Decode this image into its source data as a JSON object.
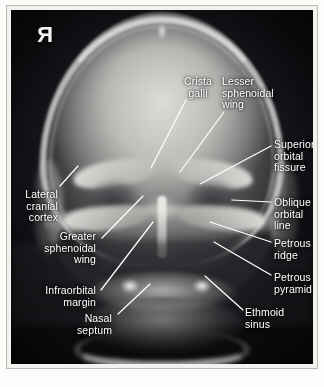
{
  "image": {
    "modality": "radiograph",
    "view": "PA skull (Caldwell) projection",
    "side_marker": "R",
    "background_color": "#16171b",
    "label_color": "#ffffff",
    "leader_color": "#ffffff",
    "frame_color": "#b9b9b4",
    "page_color": "#fcfcfa"
  },
  "annotations": [
    {
      "id": "crista-galli",
      "label": "Crista\ngalli",
      "align": "center",
      "text_x": 178,
      "text_y": 76,
      "text_w": 40,
      "leader": {
        "x1": 186,
        "y1": 100,
        "x2": 151,
        "y2": 168
      }
    },
    {
      "id": "lesser-sphenoidal-wing",
      "label": "Lesser\nsphenoidal\nwing",
      "align": "left",
      "text_x": 222,
      "text_y": 76,
      "text_w": 64,
      "leader": {
        "x1": 224,
        "y1": 112,
        "x2": 180,
        "y2": 172
      }
    },
    {
      "id": "superior-orbital-fissure",
      "label": "Superior\norbital\nfissure",
      "align": "left",
      "text_x": 274,
      "text_y": 139,
      "text_w": 52,
      "leader": {
        "x1": 271,
        "y1": 146,
        "x2": 200,
        "y2": 184
      }
    },
    {
      "id": "oblique-orbital-line",
      "label": "Oblique\norbital\nline",
      "align": "left",
      "text_x": 274,
      "text_y": 197,
      "text_w": 52,
      "leader": {
        "x1": 271,
        "y1": 202,
        "x2": 232,
        "y2": 200
      }
    },
    {
      "id": "petrous-ridge",
      "label": "Petrous\nridge",
      "align": "left",
      "text_x": 274,
      "text_y": 238,
      "text_w": 52,
      "leader": {
        "x1": 271,
        "y1": 242,
        "x2": 210,
        "y2": 222
      }
    },
    {
      "id": "petrous-pyramid",
      "label": "Petrous\npyramid",
      "align": "left",
      "text_x": 274,
      "text_y": 272,
      "text_w": 56,
      "leader": {
        "x1": 271,
        "y1": 275,
        "x2": 214,
        "y2": 242
      }
    },
    {
      "id": "ethmoid-sinus",
      "label": "Ethmoid\nsinus",
      "align": "left",
      "text_x": 245,
      "text_y": 307,
      "text_w": 56,
      "leader": {
        "x1": 243,
        "y1": 310,
        "x2": 205,
        "y2": 276
      }
    },
    {
      "id": "lateral-cranial-cortex",
      "label": "Lateral\ncranial\ncortex",
      "align": "right",
      "text_x": 6,
      "text_y": 189,
      "text_w": 52,
      "leader": {
        "x1": 60,
        "y1": 186,
        "x2": 78,
        "y2": 166
      }
    },
    {
      "id": "greater-sphenoidal-wing",
      "label": "Greater\nsphenoidal\nwing",
      "align": "right",
      "text_x": 14,
      "text_y": 231,
      "text_w": 82,
      "leader": {
        "x1": 102,
        "y1": 238,
        "x2": 143,
        "y2": 196
      }
    },
    {
      "id": "infraorbital-margin",
      "label": "Infraorbital\nmargin",
      "align": "right",
      "text_x": 14,
      "text_y": 285,
      "text_w": 82,
      "leader": {
        "x1": 101,
        "y1": 290,
        "x2": 153,
        "y2": 222
      }
    },
    {
      "id": "nasal-septum",
      "label": "Nasal\nseptum",
      "align": "right",
      "text_x": 54,
      "text_y": 313,
      "text_w": 58,
      "leader": {
        "x1": 118,
        "y1": 314,
        "x2": 150,
        "y2": 284
      }
    }
  ]
}
